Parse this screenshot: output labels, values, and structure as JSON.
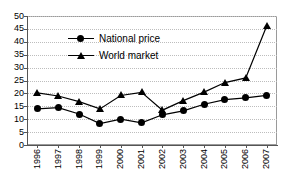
{
  "chart_data": {
    "type": "line",
    "title": "",
    "xlabel": "",
    "ylabel": "",
    "ylim": [
      0,
      50
    ],
    "ytick_step": 5,
    "yticks": [
      50,
      45,
      40,
      35,
      30,
      25,
      20,
      15,
      10,
      5,
      0
    ],
    "grid": true,
    "grid_style": "dotted",
    "legend_position": "inside-upper-left",
    "categories": [
      "1996",
      "1997",
      "1998",
      "1999",
      "2000",
      "2001",
      "2002",
      "2003",
      "2004",
      "2005",
      "2006",
      "2007"
    ],
    "series": [
      {
        "name": "National price",
        "marker": "circle",
        "color": "#000000",
        "values": [
          14.0,
          14.5,
          12.0,
          8.3,
          10.0,
          8.6,
          11.7,
          13.2,
          15.8,
          17.6,
          18.3,
          19.2
        ]
      },
      {
        "name": "World market",
        "marker": "triangle",
        "color": "#000000",
        "values": [
          20.2,
          19.0,
          16.8,
          14.0,
          19.2,
          20.4,
          13.5,
          17.2,
          20.5,
          24.2,
          26.0,
          46.0
        ]
      }
    ]
  }
}
